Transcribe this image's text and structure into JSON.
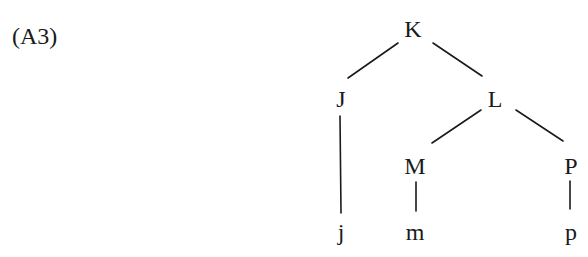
{
  "example": {
    "label": "(A3)"
  },
  "tree": {
    "nodes": {
      "K": {
        "label": "K",
        "x": 413,
        "y": 37
      },
      "J": {
        "label": "J",
        "x": 341,
        "y": 107
      },
      "L": {
        "label": "L",
        "x": 495,
        "y": 107
      },
      "M": {
        "label": "M",
        "x": 415,
        "y": 174
      },
      "P": {
        "label": "P",
        "x": 571,
        "y": 174
      },
      "j": {
        "label": "j",
        "x": 341,
        "y": 240
      },
      "m": {
        "label": "m",
        "x": 415,
        "y": 240
      },
      "p": {
        "label": "p",
        "x": 571,
        "y": 240
      }
    },
    "edges": [
      {
        "from": "K",
        "to": "J"
      },
      {
        "from": "K",
        "to": "L"
      },
      {
        "from": "J",
        "to": "j"
      },
      {
        "from": "L",
        "to": "M"
      },
      {
        "from": "L",
        "to": "P"
      },
      {
        "from": "M",
        "to": "m"
      },
      {
        "from": "P",
        "to": "p"
      }
    ]
  }
}
